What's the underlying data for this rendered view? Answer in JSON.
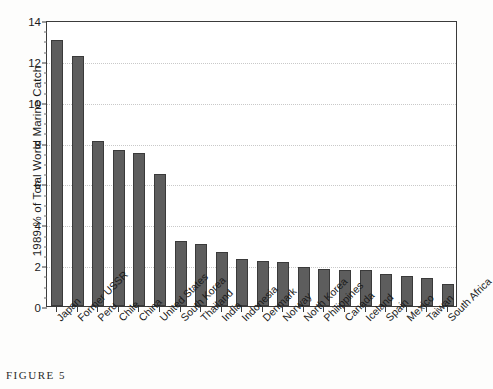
{
  "caption": "FIGURE 5",
  "chart_data": {
    "type": "bar",
    "title": "",
    "xlabel": "",
    "ylabel": "1989 % of Total World Marine Catch",
    "ylim": [
      0,
      14
    ],
    "ytick_values": [
      0,
      2,
      4,
      6,
      8,
      10,
      12,
      14
    ],
    "ytick_labels": [
      "0",
      "2",
      "4",
      "6",
      "8",
      "10",
      "12",
      "14"
    ],
    "grid": "horizontal-dotted",
    "legend": "none",
    "bar_color": "#5d5d5d",
    "bar_edge_color": "#3a3a3a",
    "categories": [
      "Japan",
      "Former USSR",
      "Peru",
      "Chile",
      "China",
      "United States",
      "South Korea",
      "Thailand",
      "India",
      "Indonesia",
      "Denmark",
      "Norway",
      "North Korea",
      "Philippines",
      "Canada",
      "Iceland",
      "Spain",
      "Mexico",
      "Taiwan",
      "South Africa"
    ],
    "values": [
      13.0,
      12.25,
      8.1,
      7.65,
      7.5,
      6.45,
      3.2,
      3.05,
      2.65,
      2.3,
      2.2,
      2.15,
      1.9,
      1.8,
      1.75,
      1.75,
      1.55,
      1.45,
      1.35,
      1.1
    ]
  }
}
